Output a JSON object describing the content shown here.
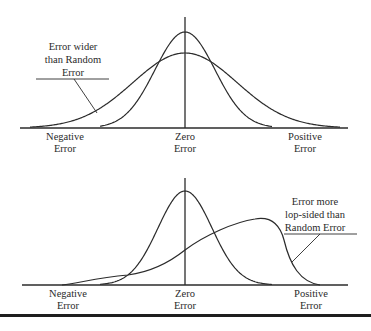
{
  "top_panel": {
    "annotation": [
      "Error wider",
      "than Random",
      "Error"
    ],
    "x_labels": [
      [
        "Negative",
        "Error"
      ],
      [
        "Zero",
        "Error"
      ],
      [
        "Positive",
        "Error"
      ]
    ],
    "curves": [
      {
        "name": "random-error",
        "shape": "normal",
        "relative_width": 1.0,
        "relative_peak": 1.0
      },
      {
        "name": "wider-error",
        "shape": "normal",
        "relative_width": 1.7,
        "relative_peak": 0.78
      }
    ]
  },
  "bottom_panel": {
    "annotation": [
      "Error more",
      "lop-sided than",
      "Random Error"
    ],
    "x_labels": [
      [
        "Negative",
        "Error"
      ],
      [
        "Zero",
        "Error"
      ],
      [
        "Positive",
        "Error"
      ]
    ],
    "curves": [
      {
        "name": "random-error",
        "shape": "normal"
      },
      {
        "name": "lopsided-error",
        "shape": "skewed-left-tail, peak toward positive"
      }
    ]
  }
}
